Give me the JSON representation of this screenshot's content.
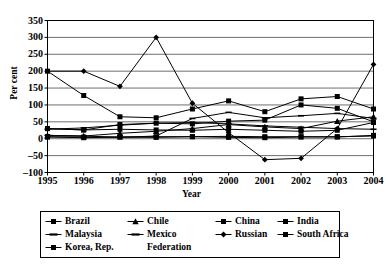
{
  "chart_data": {
    "type": "line",
    "title": "",
    "xlabel": "Year",
    "ylabel": "Per cent",
    "grid": true,
    "legend_position": "bottom",
    "categories": [
      "1995",
      "1996",
      "1997",
      "1998",
      "1999",
      "2000",
      "2001",
      "2002",
      "2003",
      "2004"
    ],
    "x": [
      1995,
      1996,
      1997,
      1998,
      1999,
      2000,
      2001,
      2002,
      2003,
      2004
    ],
    "xlim": [
      1995,
      2004
    ],
    "ylim": [
      -100,
      350
    ],
    "ytick_values": [
      350,
      300,
      250,
      200,
      150,
      100,
      50,
      0,
      -50,
      -100
    ],
    "ytick_labels": [
      "350",
      "300",
      "250",
      "200",
      "150",
      "100",
      "50",
      "0",
      "–50",
      "–100"
    ],
    "series": [
      {
        "name": "Brazil",
        "marker": "square",
        "values": [
          30,
          26,
          28,
          26,
          25,
          28,
          25,
          22,
          25,
          48
        ]
      },
      {
        "name": "Chile",
        "marker": "triangle",
        "values": [
          10,
          8,
          16,
          22,
          30,
          42,
          35,
          30,
          52,
          65
        ]
      },
      {
        "name": "China",
        "marker": "square",
        "values": [
          6,
          5,
          5,
          6,
          6,
          7,
          6,
          6,
          6,
          8
        ]
      },
      {
        "name": "India",
        "marker": "square",
        "values": [
          30,
          26,
          42,
          46,
          44,
          52,
          55,
          100,
          90,
          50
        ]
      },
      {
        "name": "Malaysia",
        "marker": "line",
        "values": [
          10,
          8,
          4,
          8,
          60,
          78,
          62,
          68,
          75,
          60
        ]
      },
      {
        "name": "Mexico",
        "marker": "line",
        "values": [
          28,
          32,
          40,
          46,
          48,
          44,
          38,
          34,
          30,
          28
        ]
      },
      {
        "name": "Russian Federation",
        "marker": "diamond",
        "values": [
          200,
          200,
          155,
          300,
          105,
          18,
          -62,
          -58,
          30,
          220
        ]
      },
      {
        "name": "South Africa",
        "marker": "square",
        "values": [
          5,
          3,
          5,
          4,
          6,
          4,
          3,
          5,
          5,
          10
        ]
      },
      {
        "name": "Korea, Rep.",
        "marker": "square",
        "values": [
          200,
          128,
          65,
          62,
          88,
          112,
          80,
          118,
          125,
          88
        ]
      }
    ],
    "legend_entries": [
      {
        "label": "Brazil",
        "marker": "square"
      },
      {
        "label": "Chile",
        "marker": "triangle"
      },
      {
        "label": "China",
        "marker": "square"
      },
      {
        "label": "India",
        "marker": "square"
      },
      {
        "label": "Malaysia",
        "marker": "line"
      },
      {
        "label": "Mexico",
        "marker": "line"
      },
      {
        "label": "Russian",
        "marker": "diamond"
      },
      {
        "label": "Federation",
        "marker": "none"
      },
      {
        "label": "South Africa",
        "marker": "square"
      },
      {
        "label": "Korea, Rep.",
        "marker": "square"
      }
    ],
    "colors": {
      "line": "#000000",
      "grid": "#6e6e6e",
      "axis": "#000000",
      "background": "#ffffff"
    }
  }
}
